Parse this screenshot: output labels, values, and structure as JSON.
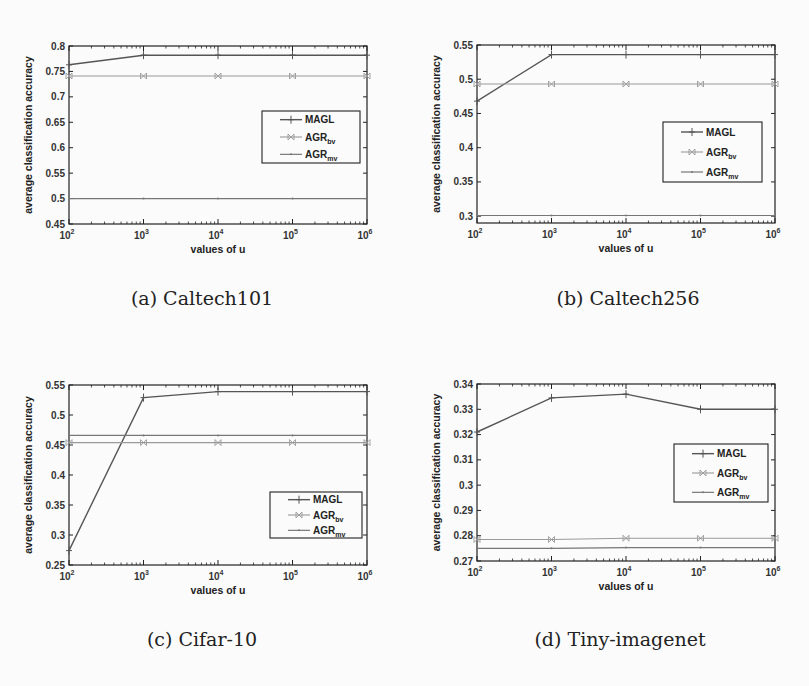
{
  "figure": {
    "panels": [
      {
        "id": "a",
        "caption": "(a) Caltech101"
      },
      {
        "id": "b",
        "caption": "(b) Caltech256"
      },
      {
        "id": "c",
        "caption": "(c) Cifar-10"
      },
      {
        "id": "d",
        "caption": "(d) Tiny-imagenet"
      }
    ],
    "colors": {
      "MAGL": "#555555",
      "AGR_bv": "#9a9a9a",
      "AGR_mv": "#777777",
      "axes": "#222222",
      "background": "#fbfbfb"
    }
  },
  "chart_data": [
    {
      "type": "line",
      "title": "(a) Caltech101",
      "xlabel": "values of u",
      "ylabel": "average classification accuracy",
      "x": [
        100,
        1000,
        10000,
        100000,
        1000000
      ],
      "xticks": [
        "10^2",
        "10^3",
        "10^4",
        "10^5",
        "10^6"
      ],
      "xscale": "log",
      "ylim": [
        0.45,
        0.8
      ],
      "yticks": [
        "0.45",
        "0.5",
        "0.55",
        "0.6",
        "0.65",
        "0.7",
        "0.75",
        "0.8"
      ],
      "grid": false,
      "legend_position": "center-right",
      "series": [
        {
          "name": "MAGL",
          "values": [
            0.763,
            0.782,
            0.782,
            0.782,
            0.782
          ],
          "marker": "+"
        },
        {
          "name": "AGR_bv",
          "values": [
            0.741,
            0.741,
            0.741,
            0.741,
            0.741
          ],
          "marker": "x"
        },
        {
          "name": "AGR_mv",
          "values": [
            0.5,
            0.5,
            0.5,
            0.5,
            0.5
          ],
          "marker": "."
        }
      ]
    },
    {
      "type": "line",
      "title": "(b) Caltech256",
      "xlabel": "values of u",
      "ylabel": "average classification accuracy",
      "x": [
        100,
        1000,
        10000,
        100000,
        1000000
      ],
      "xticks": [
        "10^2",
        "10^3",
        "10^4",
        "10^5",
        "10^6"
      ],
      "xscale": "log",
      "ylim": [
        0.29,
        0.55
      ],
      "yticks": [
        "0.3",
        "0.35",
        "0.4",
        "0.45",
        "0.5",
        "0.55"
      ],
      "grid": false,
      "legend_position": "center-right",
      "series": [
        {
          "name": "MAGL",
          "values": [
            0.468,
            0.536,
            0.536,
            0.536,
            0.536
          ],
          "marker": "+"
        },
        {
          "name": "AGR_bv",
          "values": [
            0.493,
            0.493,
            0.493,
            0.493,
            0.493
          ],
          "marker": "x"
        },
        {
          "name": "AGR_mv",
          "values": [
            0.301,
            0.301,
            0.301,
            0.301,
            0.301
          ],
          "marker": "."
        }
      ]
    },
    {
      "type": "line",
      "title": "(c) Cifar-10",
      "xlabel": "values of u",
      "ylabel": "average classification accuracy",
      "x": [
        100,
        1000,
        10000,
        100000,
        1000000
      ],
      "xticks": [
        "10^2",
        "10^3",
        "10^4",
        "10^5",
        "10^6"
      ],
      "xscale": "log",
      "ylim": [
        0.25,
        0.55
      ],
      "yticks": [
        "0.25",
        "0.3",
        "0.35",
        "0.4",
        "0.45",
        "0.5",
        "0.55"
      ],
      "grid": false,
      "legend_position": "lower-right",
      "series": [
        {
          "name": "MAGL",
          "values": [
            0.274,
            0.529,
            0.539,
            0.539,
            0.539
          ],
          "marker": "+"
        },
        {
          "name": "AGR_bv",
          "values": [
            0.454,
            0.454,
            0.454,
            0.454,
            0.454
          ],
          "marker": "x"
        },
        {
          "name": "AGR_mv",
          "values": [
            0.466,
            0.466,
            0.466,
            0.466,
            0.466
          ],
          "marker": "."
        }
      ]
    },
    {
      "type": "line",
      "title": "(d) Tiny-imagenet",
      "xlabel": "values of u",
      "ylabel": "average classification accuracy",
      "x": [
        100,
        1000,
        10000,
        100000,
        1000000
      ],
      "xticks": [
        "10^2",
        "10^3",
        "10^4",
        "10^5",
        "10^6"
      ],
      "xscale": "log",
      "ylim": [
        0.27,
        0.34
      ],
      "yticks": [
        "0.27",
        "0.28",
        "0.29",
        "0.3",
        "0.31",
        "0.32",
        "0.33",
        "0.34"
      ],
      "grid": false,
      "legend_position": "center-right",
      "series": [
        {
          "name": "MAGL",
          "values": [
            0.321,
            0.3345,
            0.336,
            0.33,
            0.33
          ],
          "marker": "+"
        },
        {
          "name": "AGR_bv",
          "values": [
            0.2785,
            0.2785,
            0.279,
            0.279,
            0.279
          ],
          "marker": "x"
        },
        {
          "name": "AGR_mv",
          "values": [
            0.275,
            0.275,
            0.2753,
            0.2753,
            0.2753
          ],
          "marker": "."
        }
      ]
    }
  ],
  "legend": {
    "items": [
      {
        "key": "MAGL",
        "label": "MAGL",
        "sub": ""
      },
      {
        "key": "AGR_bv",
        "label": "AGR",
        "sub": "bv"
      },
      {
        "key": "AGR_mv",
        "label": "AGR",
        "sub": "mv"
      }
    ]
  }
}
